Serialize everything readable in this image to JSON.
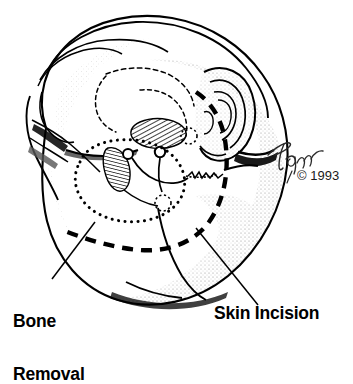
{
  "figure": {
    "background_color": "#ffffff",
    "ink_color": "#000000",
    "shading_color": "#9a9a9a"
  },
  "labels": {
    "bone_removal": {
      "line1": "Bone",
      "line2": "Removal",
      "full": "Bone Removal"
    },
    "skin_incision": {
      "text": "Skin Incision"
    }
  },
  "credit": {
    "signature": "Tagrin",
    "copyright_symbol": "©",
    "year": "1993",
    "copyright_line": "© 1993"
  },
  "annotations": {
    "bone_removal_marker": "dotted-oval-outline",
    "skin_incision_marker": "thick-dashed-curve",
    "hatched_region": "diagonal-hatched-bone-segment",
    "leader_line_left": "bone-removal-leader",
    "leader_line_right": "skin-incision-leader"
  }
}
